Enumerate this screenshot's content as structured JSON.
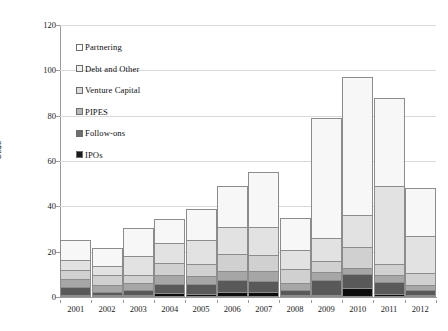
{
  "chart_data": {
    "type": "bar",
    "title": "",
    "subtitle": "",
    "xlabel": "",
    "ylabel": "US$b",
    "ylim": [
      0,
      120
    ],
    "ytick_step": 20,
    "yticks": [
      0,
      20,
      40,
      60,
      80,
      100,
      120
    ],
    "grid": true,
    "stacked": true,
    "legend_position": "inside-top-left",
    "categories": [
      "2001",
      "2002",
      "2003",
      "2004",
      "2005",
      "2006",
      "2007",
      "2008",
      "2009",
      "2010",
      "2011",
      "2012"
    ],
    "series": [
      {
        "name": "IPOs",
        "color": "#0d0d0d",
        "values": [
          1.1,
          0.4,
          0.5,
          1.8,
          1.3,
          2.2,
          2.4,
          0.2,
          0.9,
          4.0,
          1.2,
          1.0
        ]
      },
      {
        "name": "Follow-ons",
        "color": "#595959",
        "values": [
          3.3,
          1.5,
          2.4,
          4.0,
          4.5,
          5.3,
          4.6,
          2.3,
          6.8,
          6.0,
          5.5,
          2.0
        ]
      },
      {
        "name": "PIPES",
        "color": "#a6a6a6",
        "values": [
          3.6,
          3.0,
          2.8,
          4.0,
          3.5,
          4.0,
          4.4,
          3.0,
          3.3,
          3.0,
          3.0,
          2.4
        ]
      },
      {
        "name": "Venture Capital",
        "color": "#d0d0d0",
        "values": [
          4.0,
          4.2,
          3.8,
          5.2,
          5.4,
          7.5,
          7.0,
          6.0,
          5.0,
          9.0,
          5.0,
          5.1
        ]
      },
      {
        "name": "Debt and Other",
        "color": "#e2e2e2",
        "values": [
          4.5,
          4.0,
          8.0,
          9.0,
          10.3,
          12.0,
          12.6,
          8.5,
          10.0,
          14.0,
          34.3,
          16.5
        ]
      },
      {
        "name": "Partnering",
        "color": "#f7f7f7",
        "values": [
          8.5,
          7.9,
          12.5,
          10.5,
          14.0,
          18.0,
          24.0,
          14.0,
          53.0,
          61.0,
          39.0,
          21.0
        ]
      }
    ],
    "totals": [
      25.0,
      21.0,
      30.0,
      34.5,
      39.0,
      49.0,
      55.0,
      34.0,
      79.0,
      97.0,
      88.0,
      48.0
    ],
    "legend": [
      "Partnering",
      "Debt and Other",
      "Venture Capital",
      "PIPES",
      "Follow-ons",
      "IPOs"
    ],
    "legend_colors": [
      "#ffffff",
      "#f0f0f0",
      "#dcdcdc",
      "#b5b5b5",
      "#6e6e6e",
      "#1a1a1a"
    ]
  }
}
